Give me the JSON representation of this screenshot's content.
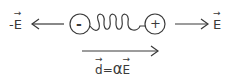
{
  "diagram": {
    "left_label": {
      "sign": "-",
      "symbol": "E"
    },
    "right_label": {
      "symbol": "E"
    },
    "negative_charge": "-",
    "positive_charge": "+",
    "bottom_label": {
      "lhs": "d",
      "eq": "=",
      "coef": "α",
      "rhs": "E"
    },
    "colors": {
      "stroke": "#3a3a3a",
      "background": "#ffffff"
    }
  }
}
